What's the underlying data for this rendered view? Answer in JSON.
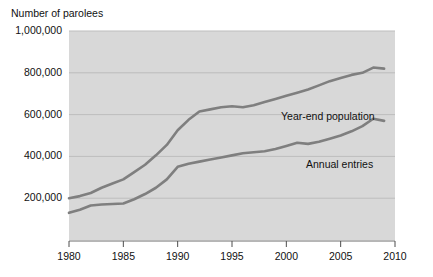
{
  "chart_data": {
    "type": "line",
    "title": "Number of parolees",
    "xlabel": "",
    "ylabel": "Number of parolees",
    "xlim": [
      1980,
      2010
    ],
    "ylim": [
      0,
      1000000
    ],
    "grid": true,
    "legend_position": "inline-annotations",
    "x_tick_labels": [
      "1980",
      "1985",
      "1990",
      "1995",
      "2000",
      "2005",
      "2010"
    ],
    "x_ticks": [
      1980,
      1985,
      1990,
      1995,
      2000,
      2005,
      2010
    ],
    "y_tick_labels": [
      "200,000",
      "400,000",
      "600,000",
      "800,000",
      "1,000,000"
    ],
    "y_ticks": [
      200000,
      400000,
      600000,
      800000,
      1000000
    ],
    "x": [
      1980,
      1981,
      1982,
      1983,
      1984,
      1985,
      1986,
      1987,
      1988,
      1989,
      1990,
      1991,
      1992,
      1993,
      1994,
      1995,
      1996,
      1997,
      1998,
      1999,
      2000,
      2001,
      2002,
      2003,
      2004,
      2005,
      2006,
      2007,
      2008,
      2009
    ],
    "series": [
      {
        "name": "Year-end population",
        "color": "#7f7f7f",
        "values": [
          200000,
          210000,
          225000,
          250000,
          270000,
          290000,
          325000,
          360000,
          405000,
          455000,
          525000,
          575000,
          615000,
          625000,
          635000,
          640000,
          635000,
          645000,
          660000,
          675000,
          690000,
          705000,
          720000,
          740000,
          760000,
          775000,
          790000,
          800000,
          825000,
          820000
        ]
      },
      {
        "name": "Annual entries",
        "color": "#7f7f7f",
        "values": [
          130000,
          145000,
          165000,
          170000,
          172000,
          175000,
          195000,
          220000,
          250000,
          290000,
          350000,
          365000,
          375000,
          385000,
          395000,
          405000,
          415000,
          420000,
          425000,
          435000,
          450000,
          465000,
          460000,
          470000,
          485000,
          500000,
          520000,
          545000,
          580000,
          570000
        ]
      }
    ],
    "annotations": [
      {
        "text": "Year-end population",
        "series": "Year-end population"
      },
      {
        "text": "Annual entries",
        "series": "Annual entries"
      }
    ],
    "colors": {
      "plot_background": "#d8d8d8",
      "gridline": "#bdbdbd",
      "line": "#7f7f7f",
      "axis": "#4d4d4d",
      "text": "#111111",
      "page_background": "#ffffff"
    }
  }
}
